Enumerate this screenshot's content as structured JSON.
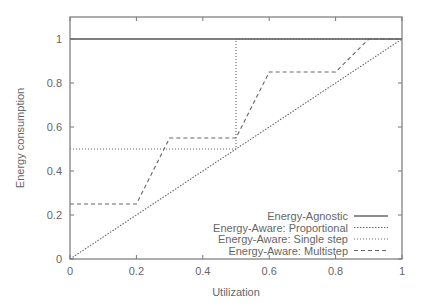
{
  "chart_data": {
    "type": "line",
    "title": "",
    "xlabel": "Utilization",
    "ylabel": "Energy consumption",
    "xlim": [
      0,
      1
    ],
    "ylim": [
      0,
      1.1
    ],
    "xticks": [
      "0",
      "0.2",
      "0.4",
      "0.6",
      "0.8",
      "1"
    ],
    "yticks": [
      "0",
      "0.2",
      "0.4",
      "0.6",
      "0.8",
      "1"
    ],
    "grid": false,
    "legend_position": "lower right",
    "series": [
      {
        "name": "Energy-Agnostic",
        "style": "solid",
        "x": [
          0,
          1
        ],
        "y": [
          1,
          1
        ]
      },
      {
        "name": "Energy-Aware: Proportional",
        "style": "dotted-dense",
        "x": [
          0,
          1
        ],
        "y": [
          0,
          1
        ]
      },
      {
        "name": "Energy-Aware: Single step",
        "style": "dotted",
        "x": [
          0,
          0.5,
          0.5,
          1
        ],
        "y": [
          0.5,
          0.5,
          1,
          1
        ]
      },
      {
        "name": "Energy-Aware: Multistep",
        "style": "dashed",
        "x": [
          0,
          0.2,
          0.3,
          0.5,
          0.6,
          0.8,
          0.9,
          1
        ],
        "y": [
          0.25,
          0.25,
          0.55,
          0.55,
          0.85,
          0.85,
          1,
          1
        ]
      }
    ]
  }
}
